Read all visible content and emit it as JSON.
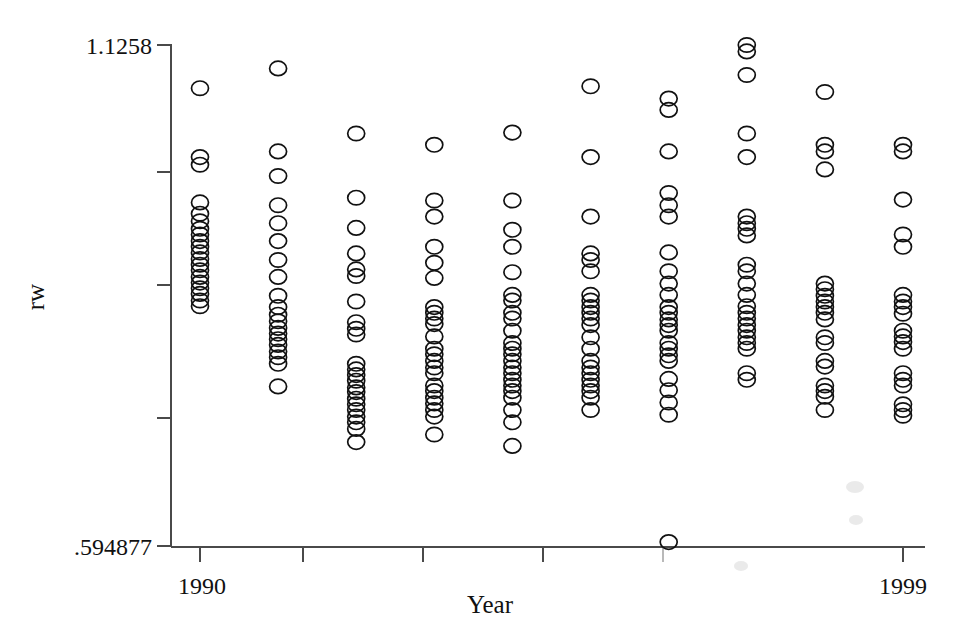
{
  "chart_data": {
    "type": "scatter",
    "title": "",
    "xlabel": "Year",
    "ylabel": "rw",
    "xlim": [
      1989.5,
      1999.8
    ],
    "ylim": [
      0.594877,
      1.1258
    ],
    "grid": false,
    "legend": "none",
    "x_tick_labels": [
      "1990",
      "1999"
    ],
    "x_tick_values": [
      1990,
      1999
    ],
    "y_tick_labels": [
      ".594877",
      "1.1258"
    ],
    "y_tick_values": [
      0.594877,
      1.1258
    ],
    "y_unlabeled_ticks": [
      1.0516,
      0.9437,
      0.8119
    ],
    "x_unlabeled_ticks": [
      1991.3,
      1992.8,
      1994.3,
      1995.8
    ],
    "marker": "open-circle",
    "marker_color": "#111111",
    "axis_color": "#4a4a4a",
    "categories": [
      1990,
      1991,
      1992,
      1993,
      1994,
      1995,
      1996,
      1997,
      1998,
      1999
    ],
    "series": [
      {
        "name": "rw",
        "points_by_year": {
          "1990": [
            1.08,
            1.007,
            0.999,
            0.959,
            0.947,
            0.939,
            0.931,
            0.925,
            0.918,
            0.912,
            0.906,
            0.899,
            0.893,
            0.887,
            0.88,
            0.874,
            0.868,
            0.862,
            0.855,
            0.849
          ],
          "1991": [
            1.101,
            1.013,
            0.987,
            0.956,
            0.937,
            0.918,
            0.898,
            0.88,
            0.86,
            0.848,
            0.84,
            0.833,
            0.826,
            0.82,
            0.814,
            0.808,
            0.801,
            0.795,
            0.788,
            0.764
          ],
          "1992": [
            1.032,
            0.964,
            0.932,
            0.905,
            0.888,
            0.881,
            0.854,
            0.832,
            0.825,
            0.819,
            0.788,
            0.782,
            0.776,
            0.77,
            0.763,
            0.758,
            0.751,
            0.745,
            0.739,
            0.732,
            0.726,
            0.719,
            0.705
          ],
          "1993": [
            1.02,
            0.961,
            0.944,
            0.912,
            0.895,
            0.879,
            0.848,
            0.842,
            0.836,
            0.83,
            0.817,
            0.804,
            0.798,
            0.791,
            0.784,
            0.778,
            0.765,
            0.759,
            0.752,
            0.746,
            0.739,
            0.732,
            0.713
          ],
          "1994": [
            1.033,
            0.961,
            0.93,
            0.912,
            0.885,
            0.861,
            0.855,
            0.842,
            0.836,
            0.823,
            0.81,
            0.804,
            0.798,
            0.791,
            0.784,
            0.778,
            0.771,
            0.765,
            0.759,
            0.752,
            0.739,
            0.726,
            0.701
          ],
          "1995": [
            1.082,
            1.007,
            0.944,
            0.905,
            0.898,
            0.886,
            0.861,
            0.855,
            0.848,
            0.842,
            0.836,
            0.829,
            0.816,
            0.804,
            0.791,
            0.784,
            0.778,
            0.771,
            0.765,
            0.759,
            0.752,
            0.739
          ],
          "1996": [
            1.069,
            1.057,
            1.013,
            0.969,
            0.956,
            0.944,
            0.906,
            0.886,
            0.873,
            0.861,
            0.848,
            0.842,
            0.835,
            0.829,
            0.823,
            0.81,
            0.804,
            0.797,
            0.791,
            0.772,
            0.76,
            0.747,
            0.734,
            0.599
          ],
          "1997": [
            1.1258,
            1.119,
            1.094,
            1.032,
            1.007,
            0.944,
            0.937,
            0.931,
            0.924,
            0.893,
            0.886,
            0.873,
            0.861,
            0.849,
            0.842,
            0.836,
            0.829,
            0.823,
            0.816,
            0.81,
            0.804,
            0.778,
            0.771
          ],
          "1998": [
            1.076,
            1.02,
            1.013,
            0.994,
            0.873,
            0.867,
            0.86,
            0.854,
            0.848,
            0.842,
            0.835,
            0.816,
            0.81,
            0.791,
            0.785,
            0.765,
            0.759,
            0.753,
            0.739
          ],
          "1999": [
            1.02,
            1.013,
            0.962,
            0.925,
            0.912,
            0.861,
            0.854,
            0.848,
            0.841,
            0.823,
            0.817,
            0.811,
            0.804,
            0.778,
            0.771,
            0.765,
            0.745,
            0.739,
            0.733
          ]
        }
      }
    ]
  }
}
